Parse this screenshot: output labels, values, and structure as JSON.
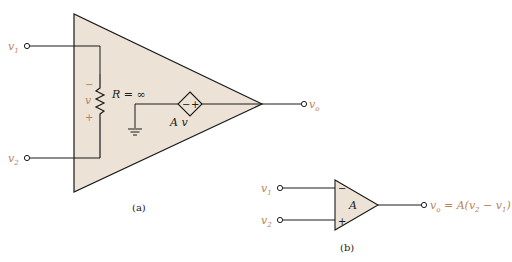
{
  "colors": {
    "fill": "#ece2d6",
    "line": "#1a1a1a",
    "label": "#b8835a",
    "caption": "#222222"
  },
  "figure_a": {
    "caption": "(a)",
    "inputs": [
      {
        "name": "v",
        "sub": "1"
      },
      {
        "name": "v",
        "sub": "2"
      }
    ],
    "output": {
      "name": "v",
      "sub": "o"
    },
    "resistor_label": "R = ∞",
    "voltage_label": "v",
    "minus_sign": "−",
    "plus_sign": "+",
    "source_label": "A v",
    "source_minus": "−",
    "source_plus": "+"
  },
  "figure_b": {
    "caption": "(b)",
    "inputs": [
      {
        "name": "v",
        "sub": "1"
      },
      {
        "name": "v",
        "sub": "2"
      }
    ],
    "gain_label": "A",
    "minus_sign": "−",
    "plus_sign": "+",
    "output_expr_prefix": "v",
    "output_expr_sub": "o",
    "output_expr_rest": " = A(v",
    "output_expr_sub2": "2",
    "output_expr_mid": " − v",
    "output_expr_sub3": "1",
    "output_expr_end": ")"
  }
}
